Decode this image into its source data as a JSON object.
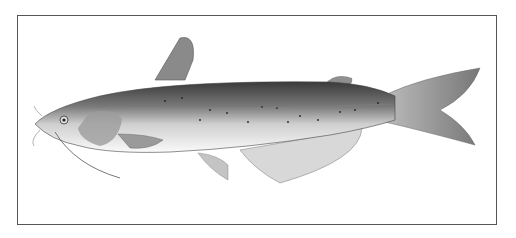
{
  "image": {
    "subject": "catfish illustration",
    "style": "grayscale",
    "background": "#ffffff",
    "frame_color": "#555555"
  }
}
